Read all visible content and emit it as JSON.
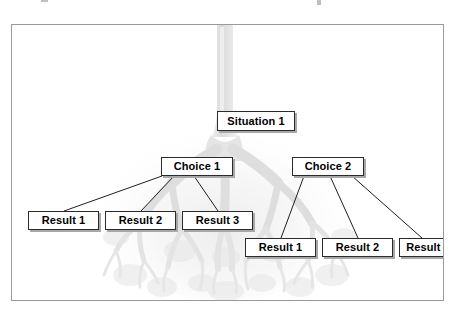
{
  "diagram": {
    "title_fragments": [
      "",
      ""
    ],
    "background_graphic": "bronchial-tree-image",
    "root": {
      "label": "Situation 1",
      "x": 205,
      "y": 86,
      "w": 78,
      "h": 20
    },
    "branches": [
      {
        "label": "Choice 1",
        "x": 149,
        "y": 132,
        "w": 72,
        "h": 19,
        "results": [
          {
            "label": "Result 1",
            "x": 16,
            "y": 186,
            "w": 71,
            "h": 19
          },
          {
            "label": "Result 2",
            "x": 93,
            "y": 186,
            "w": 71,
            "h": 19
          },
          {
            "label": "Result 3",
            "x": 170,
            "y": 186,
            "w": 71,
            "h": 19
          }
        ]
      },
      {
        "label": "Choice 2",
        "x": 280,
        "y": 132,
        "w": 72,
        "h": 19,
        "results": [
          {
            "label": "Result 1",
            "x": 233,
            "y": 213,
            "w": 71,
            "h": 19
          },
          {
            "label": "Result 2",
            "x": 310,
            "y": 213,
            "w": 71,
            "h": 19
          },
          {
            "label": "Result 3",
            "x": 387,
            "y": 213,
            "w": 58,
            "h": 19
          }
        ]
      }
    ],
    "colors": {
      "frame_border": "#9a9a9a",
      "node_border": "#2b2b2b",
      "node_fill": "#ffffff",
      "node_shadow": "#a8a8a8",
      "connector": "#1f1f1f",
      "background_art": "#b9b9b9",
      "page": "#ffffff"
    }
  }
}
